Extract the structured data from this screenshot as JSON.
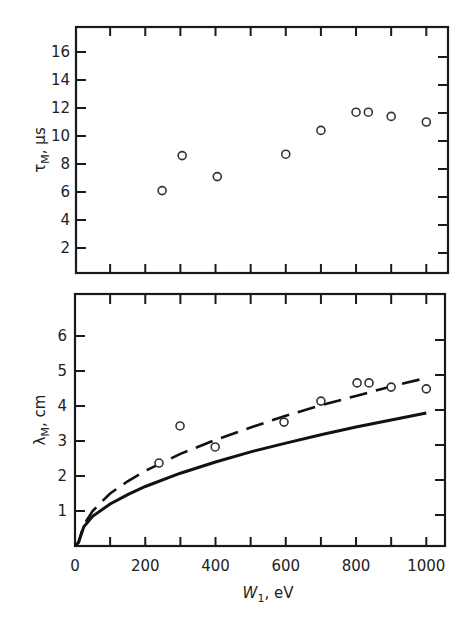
{
  "chart_data": [
    {
      "type": "scatter",
      "panel": "top",
      "title": "",
      "xlabel": "",
      "ylabel": "τ_M, μs",
      "ylabel_text": "τ",
      "ylabel_sub": "M",
      "ylabel_unit": ", μs",
      "xlim": [
        0,
        1050
      ],
      "ylim": [
        0,
        17.5
      ],
      "x_ticks": [
        100,
        200,
        300,
        400,
        500,
        600,
        700,
        800,
        900,
        1000
      ],
      "y_ticks": [
        2,
        4,
        6,
        8,
        10,
        12,
        14,
        16
      ],
      "y_tick_labels": [
        "2",
        "4",
        "6",
        "8",
        "10",
        "12",
        "14",
        "16"
      ],
      "grid": false,
      "series": [
        {
          "name": "measured τ_M",
          "marker": "open-circle",
          "x": [
            248,
            305,
            405,
            600,
            700,
            800,
            835,
            900,
            1000
          ],
          "y": [
            6.1,
            8.6,
            7.1,
            8.7,
            10.4,
            11.7,
            11.7,
            11.4,
            11.0
          ]
        }
      ]
    },
    {
      "type": "line",
      "panel": "bottom",
      "title": "",
      "xlabel": "W_1, eV",
      "xlabel_text": "W",
      "xlabel_sub": "1",
      "xlabel_unit": ", eV",
      "ylabel": "λ_M, cm",
      "ylabel_text": "λ",
      "ylabel_sub": "M",
      "ylabel_unit": ", cm",
      "xlim": [
        0,
        1050
      ],
      "ylim": [
        0,
        7.0
      ],
      "x_ticks": [
        100,
        200,
        300,
        400,
        500,
        600,
        700,
        800,
        900,
        1000
      ],
      "x_tick_labels": [
        {
          "value": 0,
          "label": "0"
        },
        {
          "value": 200,
          "label": "200"
        },
        {
          "value": 400,
          "label": "400"
        },
        {
          "value": 600,
          "label": "600"
        },
        {
          "value": 800,
          "label": "800"
        },
        {
          "value": 1000,
          "label": "1000"
        }
      ],
      "y_ticks": [
        1,
        2,
        3,
        4,
        5,
        6
      ],
      "y_tick_labels": [
        "1",
        "2",
        "3",
        "4",
        "5",
        "6"
      ],
      "grid": false,
      "series": [
        {
          "name": "measured λ_M",
          "marker": "open-circle",
          "x": [
            239,
            299,
            399,
            595,
            700,
            803,
            837,
            900,
            1000
          ],
          "y": [
            2.37,
            3.43,
            2.83,
            3.54,
            4.14,
            4.66,
            4.66,
            4.54,
            4.49
          ]
        },
        {
          "name": "dashed theory curve",
          "style": "dashed",
          "x": [
            10,
            25,
            50,
            100,
            150,
            200,
            300,
            400,
            500,
            600,
            700,
            800,
            900,
            1000
          ],
          "y": [
            0.1,
            0.6,
            1.0,
            1.5,
            1.85,
            2.15,
            2.63,
            3.03,
            3.39,
            3.72,
            4.02,
            4.29,
            4.56,
            4.8
          ]
        },
        {
          "name": "solid theory curve",
          "style": "solid",
          "x": [
            10,
            25,
            50,
            100,
            150,
            200,
            300,
            400,
            500,
            600,
            700,
            800,
            900,
            1000
          ],
          "y": [
            0.1,
            0.55,
            0.85,
            1.2,
            1.47,
            1.7,
            2.08,
            2.4,
            2.69,
            2.94,
            3.18,
            3.4,
            3.6,
            3.8
          ]
        }
      ]
    }
  ]
}
